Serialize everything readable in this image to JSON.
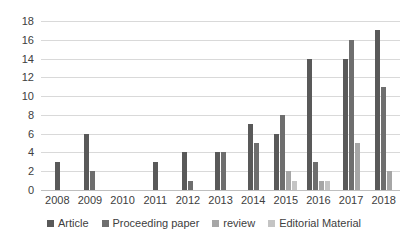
{
  "chart_data": {
    "type": "bar",
    "title": "",
    "subtitle": "",
    "xlabel": "",
    "ylabel": "",
    "grid": "horizontal",
    "legend_position": "bottom",
    "ylim": [
      0,
      18
    ],
    "yticks": [
      0,
      2,
      4,
      6,
      8,
      10,
      12,
      14,
      16,
      18
    ],
    "categories": [
      "2008",
      "2009",
      "2010",
      "2011",
      "2012",
      "2013",
      "2014",
      "2015",
      "2016",
      "2017",
      "2018"
    ],
    "series": [
      {
        "name": "Article",
        "color": "#595959",
        "values": [
          3,
          6,
          0,
          3,
          4,
          4,
          7,
          6,
          14,
          14,
          17
        ]
      },
      {
        "name": "Proceeding paper",
        "color": "#6e6e6e",
        "values": [
          0,
          2,
          0,
          0,
          1,
          4,
          5,
          8,
          3,
          16,
          11
        ]
      },
      {
        "name": "review",
        "color": "#a6a6a6",
        "values": [
          0,
          0,
          0,
          0,
          0,
          0,
          0,
          2,
          1,
          5,
          2
        ]
      },
      {
        "name": "Editorial Material",
        "color": "#c4c4c4",
        "values": [
          0,
          0,
          0,
          0,
          0,
          0,
          0,
          1,
          1,
          0,
          0
        ]
      }
    ]
  }
}
